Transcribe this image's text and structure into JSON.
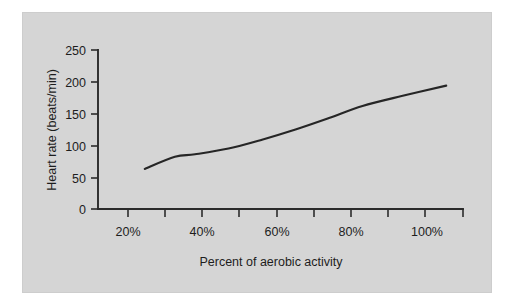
{
  "figure": {
    "panel_background": "#d5d5d5",
    "page_background": "#ffffff",
    "line_color": "#262626",
    "axis_color": "#2b2b2b"
  },
  "chart_data": {
    "type": "line",
    "title": "",
    "subtitle": "",
    "xlabel": "Percent of aerobic activity",
    "ylabel": "Heart rate (beats/min)",
    "xlim": [
      10,
      110
    ],
    "ylim": [
      0,
      250
    ],
    "grid": false,
    "legend": null,
    "x_tick_labels": [
      "20%",
      "40%",
      "60%",
      "80%",
      "100%"
    ],
    "x_tick_values": [
      20,
      40,
      60,
      80,
      100
    ],
    "x_minor_tick_values": [
      10,
      30,
      50,
      70,
      90,
      110
    ],
    "y_tick_labels": [
      "0",
      "50",
      "100",
      "150",
      "200",
      "250"
    ],
    "y_tick_values": [
      0,
      50,
      100,
      150,
      200,
      250
    ],
    "series": [
      {
        "name": "Heart rate",
        "x": [
          15,
          24,
          30,
          40,
          50,
          60,
          70,
          80,
          92,
          105
        ],
        "values": [
          63,
          82,
          86,
          95,
          109,
          125,
          143,
          162,
          178,
          194
        ]
      }
    ]
  },
  "axis": {
    "y_label_text": "Heart rate (beats/min)",
    "x_label_text": "Percent of aerobic activity",
    "y_ticks": [
      {
        "label": "250",
        "value": 250
      },
      {
        "label": "200",
        "value": 200
      },
      {
        "label": "150",
        "value": 150
      },
      {
        "label": "100",
        "value": 100
      },
      {
        "label": "50",
        "value": 50
      },
      {
        "label": "0",
        "value": 0
      }
    ],
    "x_ticks": [
      {
        "label": "20%",
        "value": 20
      },
      {
        "label": "40%",
        "value": 40
      },
      {
        "label": "60%",
        "value": 60
      },
      {
        "label": "80%",
        "value": 80
      },
      {
        "label": "100%",
        "value": 100
      }
    ]
  }
}
